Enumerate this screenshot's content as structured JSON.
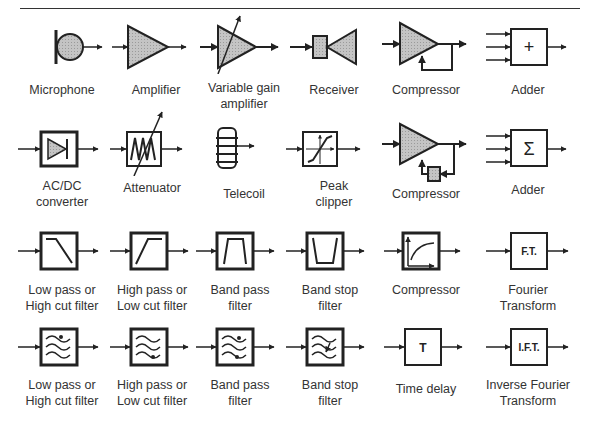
{
  "title_rule": true,
  "symbols": [
    {
      "id": "microphone",
      "label": "Microphone"
    },
    {
      "id": "amplifier",
      "label": "Amplifier"
    },
    {
      "id": "variable-gain-amplifier",
      "label": "Variable gain\namplifier"
    },
    {
      "id": "receiver",
      "label": "Receiver"
    },
    {
      "id": "compressor-1",
      "label": "Compressor"
    },
    {
      "id": "adder-plus",
      "label": "Adder",
      "glyph": "+"
    },
    {
      "id": "ac-dc-converter",
      "label": "AC/DC\nconverter"
    },
    {
      "id": "attenuator",
      "label": "Attenuator"
    },
    {
      "id": "telecoil",
      "label": "Telecoil"
    },
    {
      "id": "peak-clipper",
      "label": "Peak\nclipper"
    },
    {
      "id": "compressor-2",
      "label": "Compressor"
    },
    {
      "id": "adder-sigma",
      "label": "Adder",
      "glyph": "Σ"
    },
    {
      "id": "low-pass-filter",
      "label": "Low pass or\nHigh cut filter"
    },
    {
      "id": "high-pass-filter",
      "label": "High pass or\nLow cut filter"
    },
    {
      "id": "band-pass-filter",
      "label": "Band pass\nfilter"
    },
    {
      "id": "band-stop-filter",
      "label": "Band stop\nfilter"
    },
    {
      "id": "compressor-3",
      "label": "Compressor"
    },
    {
      "id": "fourier-transform",
      "label": "Fourier\nTransform",
      "glyph": "F.T."
    },
    {
      "id": "low-pass-filter-digital",
      "label": "Low pass or\nHigh cut filter"
    },
    {
      "id": "high-pass-filter-digital",
      "label": "High pass or\nLow cut filter"
    },
    {
      "id": "band-pass-filter-digital",
      "label": "Band pass\nfilter"
    },
    {
      "id": "band-stop-filter-digital",
      "label": "Band stop\nfilter"
    },
    {
      "id": "time-delay",
      "label": "Time delay",
      "glyph": "T"
    },
    {
      "id": "inverse-fourier-transform",
      "label": "Inverse Fourier\nTransform",
      "glyph": "I.F.T."
    }
  ],
  "colors": {
    "fill": "#bdbdbd",
    "stroke": "#222222"
  }
}
